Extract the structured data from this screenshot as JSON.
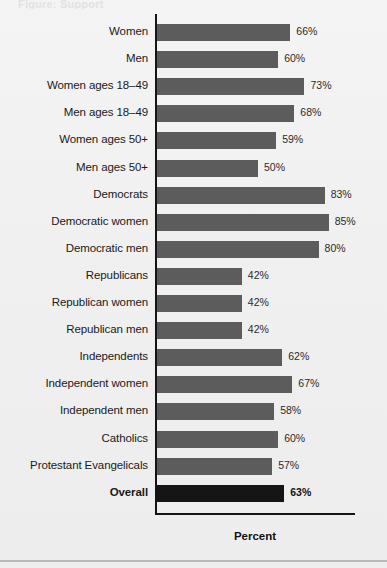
{
  "figure": {
    "top_cropped_text": "Figure: Support",
    "xlabel": "Percent",
    "bar_color": "#5c5c5c",
    "highlight_bar_color": "#151515",
    "background_color": "#f1f1f1",
    "axis_color": "#151515"
  },
  "chart_data": {
    "type": "bar",
    "orientation": "horizontal",
    "title": "",
    "subtitle": "",
    "xlabel": "Percent",
    "ylabel": "",
    "xlim": [
      0,
      100
    ],
    "grid": false,
    "legend": null,
    "value_suffix": "%",
    "categories": [
      "Women",
      "Men",
      "Women ages 18–49",
      "Men ages 18–49",
      "Women ages 50+",
      "Men ages 50+",
      "Democrats",
      "Democratic women",
      "Democratic men",
      "Republicans",
      "Republican women",
      "Republican men",
      "Independents",
      "Independent women",
      "Independent men",
      "Catholics",
      "Protestant Evangelicals",
      "Overall"
    ],
    "values": [
      66,
      60,
      73,
      68,
      59,
      50,
      83,
      85,
      80,
      42,
      42,
      42,
      62,
      67,
      58,
      60,
      57,
      63
    ],
    "value_labels": [
      "66%",
      "60%",
      "73%",
      "68%",
      "59%",
      "50%",
      "83%",
      "85%",
      "80%",
      "42%",
      "42%",
      "42%",
      "62%",
      "67%",
      "58%",
      "60%",
      "57%",
      "63%"
    ],
    "highlighted_categories": [
      "Overall"
    ]
  }
}
